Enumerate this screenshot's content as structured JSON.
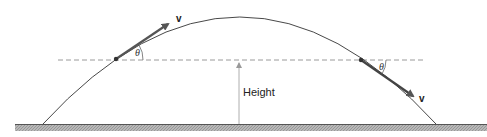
{
  "diagram": {
    "labels": {
      "height": "Height",
      "velocity_left": "v",
      "velocity_right": "v",
      "angle_left": "θ",
      "angle_right": "θ"
    },
    "colors": {
      "curve": "#333333",
      "ground": "#8a8a8a",
      "dashed": "#9a9a9a",
      "arrow": "#444444"
    }
  }
}
